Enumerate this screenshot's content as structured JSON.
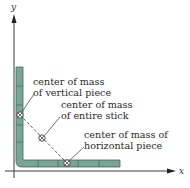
{
  "diagram": {
    "axes": {
      "x_label": "x",
      "y_label": "y",
      "axis_color": "#3a3a3a"
    },
    "stick": {
      "fill_color": "#7aa594",
      "stroke_color": "#3f6b5c",
      "vertical_piece": {
        "x": 16,
        "y_top": 67,
        "y_bottom": 167,
        "width": 7
      },
      "horizontal_piece": {
        "x_left": 16,
        "x_right": 120,
        "y": 160,
        "height": 7
      }
    },
    "points": {
      "vertical_cm": {
        "x": 20,
        "y": 115
      },
      "entire_cm": {
        "x": 42,
        "y": 138
      },
      "horizontal_cm": {
        "x": 67,
        "y": 163
      }
    },
    "labels": {
      "vertical_cm": {
        "line1": "center of mass",
        "line2": "of vertical piece"
      },
      "entire_cm": {
        "line1": "center of mass",
        "line2": "of entire stick"
      },
      "horizontal_cm": {
        "line1": "center of mass of",
        "line2": "horizontal piece"
      }
    }
  }
}
